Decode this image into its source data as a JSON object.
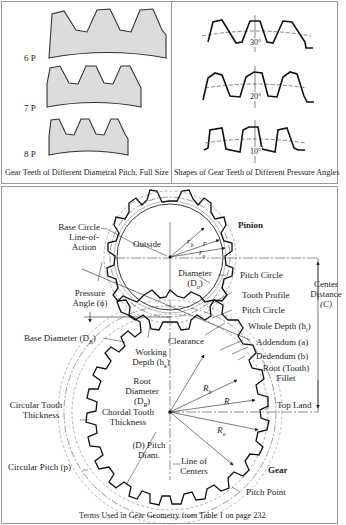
{
  "top_left_panel": {
    "caption": "Gear Teeth of Different Diametral Pitch, Full Size",
    "rows": [
      {
        "label": "6 P",
        "teeth": 3
      },
      {
        "label": "7 P",
        "teeth": 3
      },
      {
        "label": "8 P",
        "teeth": 3
      }
    ],
    "fill_color": "#dcdcdc"
  },
  "top_right_panel": {
    "caption": "Shapes of Gear Teeth of Different Pressure Angles",
    "rows": [
      {
        "angle_label": "30°"
      },
      {
        "angle_label": "20°"
      },
      {
        "angle_label": "10°"
      }
    ]
  },
  "bottom_panel": {
    "caption": "Terms Used in Gear Geometry from Table 1 on page 232",
    "pinion_title": "Pinion",
    "gear_title": "Gear",
    "labels": {
      "base_circle": "Base Circle",
      "line_of_action_1": "Line-of-",
      "line_of_action_2": "Action",
      "outside": "Outside",
      "diameter": "Diameter",
      "d_o": "(D",
      "d_o_sub": "o",
      "d_o_end": ")",
      "r_b": "r",
      "r_b_sub": "b",
      "r": "r",
      "r_o": "r",
      "r_o_sub": "o",
      "pitch_circle_1": "Pitch Circle",
      "pressure_angle_1": "Pressure",
      "pressure_angle_2": "Angle (ϕ)",
      "tooth_profile": "Tooth Profile",
      "pitch_circle_2": "Pitch Circle",
      "center_distance_1": "Center",
      "center_distance_2": "Distance",
      "center_distance_3": "(C)",
      "base_diameter": "Base Diameter (D",
      "base_diameter_sub": "B",
      "base_diameter_end": ")",
      "whole_depth": "Whole Depth (h",
      "whole_depth_sub": "t",
      "whole_depth_end": ")",
      "clearance": "Clearance",
      "addendum": "Addendum (a)",
      "working_1": "Working",
      "working_2": "Depth (h",
      "working_sub": "k",
      "working_end": ")",
      "dedendum": "Dedendum (b)",
      "root_1": "Root",
      "root_2": "Diameter",
      "root_3": "(D",
      "root_sub": "R",
      "root_end": ")",
      "root_fillet_1": "Root (Tooth)",
      "root_fillet_2": "Fillet",
      "R_b": "R",
      "R_b_sub": "b",
      "R": "R",
      "R_o": "R",
      "R_o_sub": "o",
      "top_land": "Top Land",
      "circular_tooth_1": "Circular Tooth",
      "circular_tooth_2": "Thickness",
      "chordal_1": "Chordal Tooth",
      "chordal_2": "Thickness",
      "pitch_diam_1": "(D) Pitch",
      "pitch_diam_2": "Diam.",
      "line_of_centers_1": "Line of",
      "line_of_centers_2": "Centers",
      "circular_pitch": "Circular Pitch (p)",
      "pitch_point": "Pitch Point"
    }
  }
}
